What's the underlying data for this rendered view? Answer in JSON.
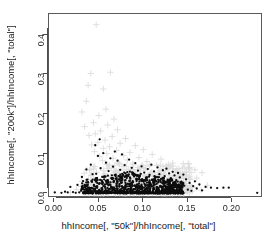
{
  "chart_data": {
    "type": "scatter",
    "title": "",
    "xlabel": "hhIncome[, \"50k\"]/hhIncome[, \"total\"]",
    "ylabel": "hhIncome[, \"200k\"]/hhIncome[, \"total\"]",
    "xlim": [
      -0.006,
      0.2345
    ],
    "ylim": [
      -0.012,
      0.452
    ],
    "xticks": [
      0.0,
      0.05,
      0.1,
      0.15,
      0.2
    ],
    "xticklabels": [
      "0.00",
      "0.05",
      "0.10",
      "0.15",
      "0.20"
    ],
    "yticks": [
      0.0,
      0.1,
      0.2,
      0.3,
      0.4
    ],
    "yticklabels": [
      "0.0",
      "0.1",
      "0.2",
      "0.3",
      "0.4"
    ],
    "grid": false,
    "legend": "none",
    "frame": true,
    "series": [
      {
        "name": "gray-cross-series",
        "marker": "plus",
        "color": "#dcdcdc",
        "size": 3.2,
        "points": [
          [
            0.047,
            0.425
          ],
          [
            0.063,
            0.305
          ],
          [
            0.041,
            0.302
          ],
          [
            0.038,
            0.272
          ],
          [
            0.055,
            0.263
          ],
          [
            0.036,
            0.232
          ],
          [
            0.031,
            0.205
          ],
          [
            0.058,
            0.212
          ],
          [
            0.05,
            0.196
          ],
          [
            0.067,
            0.187
          ],
          [
            0.044,
            0.178
          ],
          [
            0.06,
            0.172
          ],
          [
            0.034,
            0.168
          ],
          [
            0.071,
            0.16
          ],
          [
            0.052,
            0.157
          ],
          [
            0.046,
            0.15
          ],
          [
            0.039,
            0.146
          ],
          [
            0.065,
            0.143
          ],
          [
            0.08,
            0.138
          ],
          [
            0.057,
            0.134
          ],
          [
            0.049,
            0.128
          ],
          [
            0.074,
            0.126
          ],
          [
            0.042,
            0.122
          ],
          [
            0.091,
            0.12
          ],
          [
            0.062,
            0.117
          ],
          [
            0.055,
            0.113
          ],
          [
            0.1,
            0.11
          ],
          [
            0.07,
            0.108
          ],
          [
            0.045,
            0.105
          ],
          [
            0.085,
            0.103
          ],
          [
            0.059,
            0.1
          ],
          [
            0.11,
            0.098
          ],
          [
            0.078,
            0.095
          ],
          [
            0.051,
            0.093
          ],
          [
            0.095,
            0.09
          ],
          [
            0.066,
            0.088
          ],
          [
            0.12,
            0.086
          ],
          [
            0.082,
            0.084
          ],
          [
            0.054,
            0.082
          ],
          [
            0.104,
            0.08
          ],
          [
            0.072,
            0.078
          ],
          [
            0.133,
            0.076
          ],
          [
            0.088,
            0.074
          ],
          [
            0.06,
            0.072
          ],
          [
            0.115,
            0.07
          ],
          [
            0.076,
            0.068
          ],
          [
            0.146,
            0.066
          ],
          [
            0.094,
            0.065
          ],
          [
            0.064,
            0.063
          ],
          [
            0.125,
            0.062
          ],
          [
            0.083,
            0.06
          ],
          [
            0.158,
            0.059
          ],
          [
            0.101,
            0.057
          ],
          [
            0.069,
            0.056
          ],
          [
            0.136,
            0.055
          ],
          [
            0.09,
            0.053
          ],
          [
            0.166,
            0.052
          ],
          [
            0.108,
            0.051
          ],
          [
            0.073,
            0.05
          ],
          [
            0.144,
            0.049
          ],
          [
            0.097,
            0.047
          ],
          [
            0.056,
            0.046
          ],
          [
            0.118,
            0.045
          ],
          [
            0.079,
            0.044
          ],
          [
            0.152,
            0.043
          ],
          [
            0.105,
            0.042
          ],
          [
            0.068,
            0.041
          ],
          [
            0.128,
            0.04
          ],
          [
            0.086,
            0.039
          ],
          [
            0.16,
            0.038
          ],
          [
            0.112,
            0.037
          ],
          [
            0.075,
            0.036
          ],
          [
            0.137,
            0.035
          ],
          [
            0.093,
            0.034
          ],
          [
            0.048,
            0.033
          ],
          [
            0.121,
            0.032
          ],
          [
            0.081,
            0.031
          ],
          [
            0.148,
            0.03
          ],
          [
            0.102,
            0.029
          ],
          [
            0.063,
            0.028
          ],
          [
            0.131,
            0.027
          ],
          [
            0.089,
            0.026
          ],
          [
            0.038,
            0.025
          ],
          [
            0.114,
            0.024
          ],
          [
            0.077,
            0.023
          ],
          [
            0.141,
            0.022
          ],
          [
            0.098,
            0.021
          ],
          [
            0.058,
            0.02
          ],
          [
            0.124,
            0.019
          ],
          [
            0.084,
            0.018
          ],
          [
            0.03,
            0.017
          ],
          [
            0.107,
            0.016
          ],
          [
            0.07,
            0.015
          ],
          [
            0.134,
            0.014
          ],
          [
            0.092,
            0.013
          ],
          [
            0.05,
            0.012
          ],
          [
            0.117,
            0.011
          ],
          [
            0.08,
            0.01
          ],
          [
            0.025,
            0.009
          ],
          [
            0.1,
            0.008
          ],
          [
            0.065,
            0.007
          ],
          [
            0.127,
            0.006
          ],
          [
            0.087,
            0.005
          ],
          [
            0.043,
            0.004
          ],
          [
            0.11,
            0.003
          ],
          [
            0.072,
            0.002
          ],
          [
            0.018,
            0.002
          ],
          [
            0.095,
            0.001
          ],
          [
            0.14,
            0.01
          ],
          [
            0.155,
            0.015
          ],
          [
            0.165,
            0.008
          ],
          [
            0.172,
            0.02
          ]
        ]
      },
      {
        "name": "black-dot-series",
        "marker": "circle",
        "color": "#0d0d0d",
        "size": 2.3,
        "points": [
          [
            0.0005,
            0.002
          ],
          [
            0.012,
            0.004
          ],
          [
            0.018,
            0.016
          ],
          [
            0.021,
            0.003
          ],
          [
            0.026,
            0.021
          ],
          [
            0.028,
            0.002
          ],
          [
            0.031,
            0.041
          ],
          [
            0.033,
            0.014
          ],
          [
            0.035,
            0.003
          ],
          [
            0.036,
            0.06
          ],
          [
            0.038,
            0.027
          ],
          [
            0.04,
            0.008
          ],
          [
            0.041,
            0.072
          ],
          [
            0.043,
            0.034
          ],
          [
            0.044,
            0.002
          ],
          [
            0.046,
            0.121
          ],
          [
            0.047,
            0.049
          ],
          [
            0.048,
            0.018
          ],
          [
            0.049,
            0.094
          ],
          [
            0.05,
            0.005
          ],
          [
            0.051,
            0.136
          ],
          [
            0.052,
            0.063
          ],
          [
            0.053,
            0.025
          ],
          [
            0.054,
            0.009
          ],
          [
            0.055,
            0.101
          ],
          [
            0.056,
            0.042
          ],
          [
            0.057,
            0.016
          ],
          [
            0.058,
            0.077
          ],
          [
            0.059,
            0.031
          ],
          [
            0.06,
            0.004
          ],
          [
            0.061,
            0.056
          ],
          [
            0.062,
            0.022
          ],
          [
            0.063,
            0.088
          ],
          [
            0.064,
            0.038
          ],
          [
            0.065,
            0.012
          ],
          [
            0.066,
            0.067
          ],
          [
            0.067,
            0.029
          ],
          [
            0.068,
            0.105
          ],
          [
            0.069,
            0.047
          ],
          [
            0.07,
            0.018
          ],
          [
            0.071,
            0.082
          ],
          [
            0.072,
            0.035
          ],
          [
            0.073,
            0.007
          ],
          [
            0.074,
            0.059
          ],
          [
            0.075,
            0.026
          ],
          [
            0.076,
            0.098
          ],
          [
            0.077,
            0.044
          ],
          [
            0.078,
            0.015
          ],
          [
            0.079,
            0.071
          ],
          [
            0.08,
            0.033
          ],
          [
            0.081,
            0.003
          ],
          [
            0.082,
            0.053
          ],
          [
            0.083,
            0.023
          ],
          [
            0.084,
            0.085
          ],
          [
            0.085,
            0.04
          ],
          [
            0.086,
            0.011
          ],
          [
            0.087,
            0.064
          ],
          [
            0.088,
            0.028
          ],
          [
            0.089,
            0.049
          ],
          [
            0.09,
            0.019
          ],
          [
            0.091,
            0.076
          ],
          [
            0.092,
            0.036
          ],
          [
            0.093,
            0.006
          ],
          [
            0.094,
            0.057
          ],
          [
            0.095,
            0.024
          ],
          [
            0.096,
            0.043
          ],
          [
            0.097,
            0.014
          ],
          [
            0.098,
            0.068
          ],
          [
            0.099,
            0.031
          ],
          [
            0.1,
            0.002
          ],
          [
            0.101,
            0.052
          ],
          [
            0.102,
            0.021
          ],
          [
            0.103,
            0.039
          ],
          [
            0.104,
            0.01
          ],
          [
            0.105,
            0.061
          ],
          [
            0.106,
            0.027
          ],
          [
            0.107,
            0.046
          ],
          [
            0.108,
            0.017
          ],
          [
            0.109,
            0.072
          ],
          [
            0.11,
            0.034
          ],
          [
            0.111,
            0.005
          ],
          [
            0.112,
            0.055
          ],
          [
            0.113,
            0.022
          ],
          [
            0.114,
            0.041
          ],
          [
            0.115,
            0.013
          ],
          [
            0.116,
            0.065
          ],
          [
            0.117,
            0.029
          ],
          [
            0.118,
            0.048
          ],
          [
            0.119,
            0.018
          ],
          [
            0.12,
            0.036
          ],
          [
            0.121,
            0.008
          ],
          [
            0.122,
            0.058
          ],
          [
            0.123,
            0.025
          ],
          [
            0.124,
            0.043
          ],
          [
            0.125,
            0.015
          ],
          [
            0.126,
            0.062
          ],
          [
            0.127,
            0.03
          ],
          [
            0.128,
            0.004
          ],
          [
            0.129,
            0.05
          ],
          [
            0.13,
            0.02
          ],
          [
            0.131,
            0.038
          ],
          [
            0.132,
            0.011
          ],
          [
            0.133,
            0.054
          ],
          [
            0.134,
            0.026
          ],
          [
            0.135,
            0.045
          ],
          [
            0.136,
            0.016
          ],
          [
            0.137,
            0.033
          ],
          [
            0.138,
            0.007
          ],
          [
            0.139,
            0.051
          ],
          [
            0.14,
            0.022
          ],
          [
            0.141,
            0.04
          ],
          [
            0.142,
            0.013
          ],
          [
            0.143,
            0.029
          ],
          [
            0.144,
            0.003
          ],
          [
            0.145,
            0.047
          ],
          [
            0.146,
            0.019
          ],
          [
            0.148,
            0.035
          ],
          [
            0.15,
            0.009
          ],
          [
            0.152,
            0.026
          ],
          [
            0.154,
            0.006
          ],
          [
            0.156,
            0.018
          ],
          [
            0.158,
            0.03
          ],
          [
            0.16,
            0.012
          ],
          [
            0.163,
            0.022
          ],
          [
            0.166,
            0.007
          ],
          [
            0.17,
            0.016
          ],
          [
            0.176,
            0.014
          ],
          [
            0.183,
            0.013
          ],
          [
            0.19,
            0.014
          ],
          [
            0.196,
            0.014
          ],
          [
            0.228,
            0.001
          ],
          [
            0.043,
            0.048
          ],
          [
            0.047,
            0.031
          ],
          [
            0.038,
            0.014
          ],
          [
            0.055,
            0.018
          ],
          [
            0.062,
            0.011
          ],
          [
            0.07,
            0.009
          ],
          [
            0.078,
            0.006
          ],
          [
            0.086,
            0.004
          ],
          [
            0.094,
            0.003
          ],
          [
            0.102,
            0.007
          ],
          [
            0.11,
            0.002
          ],
          [
            0.118,
            0.005
          ],
          [
            0.126,
            0.002
          ],
          [
            0.134,
            0.009
          ],
          [
            0.142,
            0.002
          ],
          [
            0.03,
            0.006
          ],
          [
            0.024,
            0.001
          ],
          [
            0.015,
            0.002
          ],
          [
            0.008,
            0.001
          ]
        ]
      }
    ]
  }
}
